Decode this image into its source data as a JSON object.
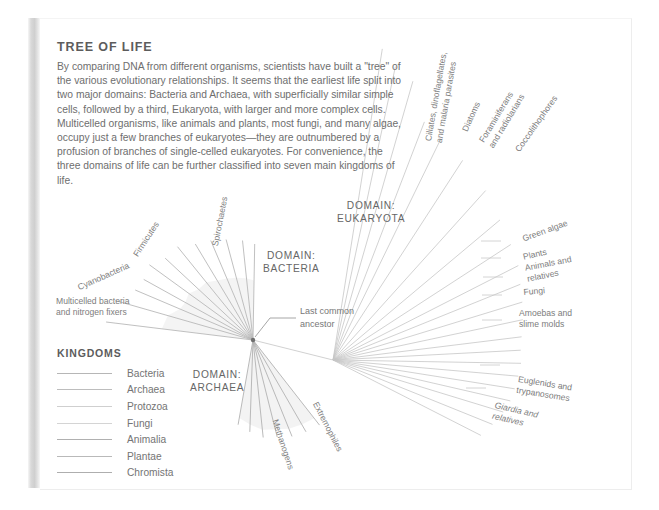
{
  "page": {
    "title": "TREE OF LIFE",
    "intro": "By comparing DNA from different organisms, scientists have built a \"tree\" of the various evolutionary relationships. It seems that the earliest life split into two major domains: Bacteria and Archaea, with superficially similar simple cells, followed by a third, Eukaryota, with larger and more complex cells. Multicelled organisms, like animals and plants, most fungi, and many algae, occupy just a few branches of eukaryotes—they are outnumbered by a profusion of branches of single-celled eukaryotes. For convenience, the three domains of life can be further classified into seven main kingdoms of life."
  },
  "legend": {
    "title": "KINGDOMS",
    "items": [
      {
        "label": "Bacteria",
        "color": "#b6b6b6"
      },
      {
        "label": "Archaea",
        "color": "#bdbdbd"
      },
      {
        "label": "Protozoa",
        "color": "#cfcfcf"
      },
      {
        "label": "Fungi",
        "color": "#d4d4d4"
      },
      {
        "label": "Animalia",
        "color": "#b0b0b0"
      },
      {
        "label": "Plantae",
        "color": "#b9b9b9"
      },
      {
        "label": "Chromista",
        "color": "#aeaeae"
      }
    ]
  },
  "domains": [
    {
      "name": "DOMAIN:\nBACTERIA",
      "x": 263,
      "y": 249
    },
    {
      "name": "DOMAIN:\nEUKARYOTA",
      "x": 337,
      "y": 199
    },
    {
      "name": "DOMAIN:\nARCHAEA",
      "x": 190,
      "y": 368
    }
  ],
  "annotations": {
    "ancestor": "Last common\nancestor"
  },
  "branch_labels": [
    {
      "id": "multicelled-bacteria",
      "text": "Multicelled bacteria\nand nitrogen fixers",
      "x": 56,
      "y": 296,
      "rot": 0
    },
    {
      "id": "cyanobacteria",
      "text": "Cyanobacteria",
      "x": 76,
      "y": 283,
      "rot": -24
    },
    {
      "id": "firmicutes",
      "text": "Firmicutes",
      "x": 131,
      "y": 253,
      "rot": -57
    },
    {
      "id": "spirochaetes",
      "text": "Spirochaetes",
      "x": 210,
      "y": 245,
      "rot": -79
    },
    {
      "id": "ciliates",
      "text": "Ciliates, dinoflagellates,\nand malaria parasites",
      "x": 423,
      "y": 140,
      "rot": -80
    },
    {
      "id": "diatoms",
      "text": "Diatoms",
      "x": 460,
      "y": 129,
      "rot": -66
    },
    {
      "id": "foraminiferans",
      "text": "Foraminiferans\nand radiolarians",
      "x": 477,
      "y": 139,
      "rot": -59
    },
    {
      "id": "coccolithophores",
      "text": "Coccolithophores",
      "x": 513,
      "y": 148,
      "rot": -55
    },
    {
      "id": "green-algae",
      "text": "Green algae",
      "x": 521,
      "y": 234,
      "rot": -20
    },
    {
      "id": "plants",
      "text": "Plants",
      "x": 522,
      "y": 252,
      "rot": -13
    },
    {
      "id": "animals",
      "text": "Animals and\nrelatives",
      "x": 524,
      "y": 263,
      "rot": -11
    },
    {
      "id": "fungi",
      "text": "Fungi",
      "x": 523,
      "y": 287,
      "rot": -5
    },
    {
      "id": "amoebas",
      "text": "Amoebas and\nslime molds",
      "x": 519,
      "y": 308,
      "rot": 0
    },
    {
      "id": "euglenids",
      "text": "Euglenids and\ntrypanosomes",
      "x": 519,
      "y": 374,
      "rot": 9
    },
    {
      "id": "giardia",
      "text": "Giardia and\nrelatives",
      "x": 496,
      "y": 400,
      "rot": 13,
      "italic": true
    },
    {
      "id": "methanogens",
      "text": "Methanogens",
      "x": 280,
      "y": 418,
      "rot": 72
    },
    {
      "id": "extremophiles",
      "text": "Extremophiles",
      "x": 320,
      "y": 400,
      "rot": 63
    }
  ],
  "tree": {
    "root": {
      "x": 253,
      "y": 340
    },
    "eukaryote_hub": {
      "x": 333,
      "y": 360
    },
    "line_color": "#b9b9b9",
    "fan_fill": "#f2f2f2",
    "bacteria_branches": [
      {
        "angle": 187,
        "len": 148
      },
      {
        "angle": 196,
        "len": 143
      },
      {
        "angle": 203,
        "len": 128
      },
      {
        "angle": 209,
        "len": 125
      },
      {
        "angle": 216,
        "len": 128
      },
      {
        "angle": 223,
        "len": 120
      },
      {
        "angle": 231,
        "len": 120
      },
      {
        "angle": 239,
        "len": 112
      },
      {
        "angle": 247,
        "len": 108
      },
      {
        "angle": 255,
        "len": 104
      },
      {
        "angle": 264,
        "len": 100
      },
      {
        "angle": 271,
        "len": 96
      }
    ],
    "archaea_branches": [
      {
        "angle": 52,
        "len": 108
      },
      {
        "angle": 60,
        "len": 106
      },
      {
        "angle": 68,
        "len": 104
      },
      {
        "angle": 76,
        "len": 100
      },
      {
        "angle": 84,
        "len": 98
      },
      {
        "angle": 92,
        "len": 92
      },
      {
        "angle": 100,
        "len": 86
      }
    ],
    "eukaryote_branches": [
      {
        "angle": -81,
        "len": 315
      },
      {
        "angle": -78,
        "len": 300
      },
      {
        "angle": -74,
        "len": 290
      },
      {
        "angle": -69,
        "len": 255
      },
      {
        "angle": -64,
        "len": 245
      },
      {
        "angle": -57,
        "len": 238
      },
      {
        "angle": -48,
        "len": 228
      },
      {
        "angle": -40,
        "len": 218
      },
      {
        "angle": -33,
        "len": 212
      },
      {
        "angle": -27,
        "len": 208
      },
      {
        "angle": -22,
        "len": 202
      },
      {
        "angle": -17,
        "len": 198
      },
      {
        "angle": -12,
        "len": 194
      },
      {
        "angle": -7,
        "len": 190
      },
      {
        "angle": -3,
        "len": 188
      },
      {
        "angle": 1,
        "len": 188
      },
      {
        "angle": 5,
        "len": 186
      },
      {
        "angle": 9,
        "len": 184
      },
      {
        "angle": 13,
        "len": 182
      },
      {
        "angle": 17,
        "len": 178
      },
      {
        "angle": 22,
        "len": 172
      },
      {
        "angle": 27,
        "len": 166
      }
    ]
  }
}
